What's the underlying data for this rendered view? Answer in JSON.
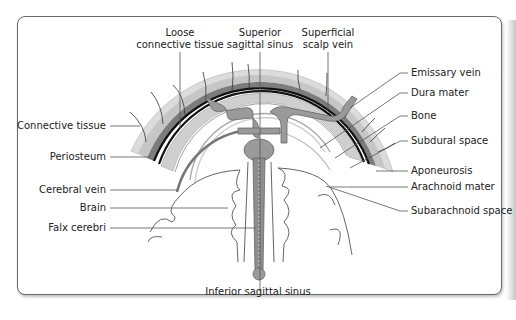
{
  "figure": {
    "labels_top": [
      {
        "id": "loose-ct",
        "line1": "Loose",
        "line2": "connective tissue"
      },
      {
        "id": "superior-sagittal-sinus",
        "line1": "Superior",
        "line2": "sagittal sinus"
      },
      {
        "id": "superficial-scalp-vein",
        "line1": "Superficial",
        "line2": "scalp vein"
      }
    ],
    "labels_left": [
      {
        "id": "connective-tissue",
        "text": "Connective tissue"
      },
      {
        "id": "periosteum",
        "text": "Periosteum"
      },
      {
        "id": "cerebral-vein",
        "text": "Cerebral vein"
      },
      {
        "id": "brain",
        "text": "Brain"
      },
      {
        "id": "falx-cerebri",
        "text": "Falx cerebri"
      }
    ],
    "labels_right": [
      {
        "id": "emissary-vein",
        "text": "Emissary vein"
      },
      {
        "id": "dura-mater",
        "text": "Dura mater"
      },
      {
        "id": "bone",
        "text": "Bone"
      },
      {
        "id": "subdural-space",
        "text": "Subdural space"
      },
      {
        "id": "aponeurosis",
        "text": "Aponeurosis"
      },
      {
        "id": "arachnoid-mater",
        "text": "Arachnoid mater"
      },
      {
        "id": "subarachnoid-space",
        "text": "Subarachnoid space"
      }
    ],
    "label_bottom": {
      "id": "inferior-sagittal-sinus",
      "text": "Inferior sagittal sinus"
    },
    "colors": {
      "skin": "#dcdcdc",
      "connective": "#c6c6c6",
      "aponeurosis": "#7c7c7c",
      "black_line": "#111111",
      "bone": "#cfcfcf",
      "sinus": "#9a9a9a",
      "leader_line": "#555555",
      "frame": "#6a6a6a"
    }
  }
}
